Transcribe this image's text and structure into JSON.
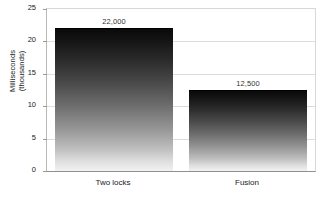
{
  "chart_data": {
    "type": "bar",
    "title": "",
    "subtitle": "",
    "xlabel": "",
    "ylabel": "Milliseconds (thousands)",
    "ylabel_line1": "Milliseconds",
    "ylabel_line2": "(thousands)",
    "categories": [
      "Two locks",
      "Fusion"
    ],
    "values": [
      22,
      12.5
    ],
    "value_labels": [
      "22,000",
      "12,500"
    ],
    "ylim": [
      0,
      25
    ],
    "ytick_values": [
      0,
      5,
      10,
      15,
      20,
      25
    ],
    "ytick_labels": [
      "0",
      "5",
      "10",
      "15",
      "20",
      "25"
    ],
    "grid": true,
    "grid_axis": "y",
    "legend": false,
    "legend_position": "none",
    "bar_style": "vertical-gradient-grayscale",
    "colors": {
      "bar_top": "#0a0a0a",
      "bar_bottom": "#f2f2f2",
      "gridline": "#dcdcdc",
      "axis": "#8f8f8f",
      "text": "#1a1a1a",
      "value_label": "#333333",
      "background": "#ffffff"
    }
  }
}
